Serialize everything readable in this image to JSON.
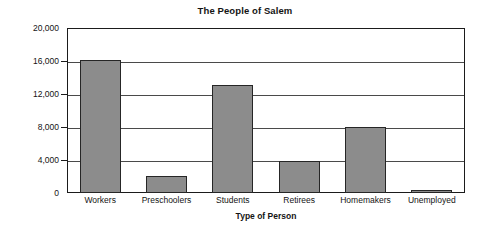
{
  "chart_data": {
    "type": "bar",
    "title": "The People of Salem",
    "xlabel": "Type of Person",
    "ylabel": "Number Living in Salem",
    "categories": [
      "Workers",
      "Preschoolers",
      "Students",
      "Retirees",
      "Homemakers",
      "Unemployed"
    ],
    "values": [
      16100,
      2100,
      13100,
      3900,
      8000,
      400
    ],
    "ylim": [
      0,
      20000
    ],
    "ytick_values": [
      0,
      4000,
      8000,
      12000,
      16000,
      20000
    ],
    "ytick_labels": [
      "0",
      "4,000",
      "8,000",
      "12,000",
      "16,000",
      "20,000"
    ],
    "grid": "horizontal",
    "legend": "none",
    "bar_color": "#8c8c8c",
    "bar_edge_color": "#262626",
    "axis_color": "#1b1b1b",
    "gridline_color": "#4a4a4a",
    "background_color": "#ffffff"
  }
}
